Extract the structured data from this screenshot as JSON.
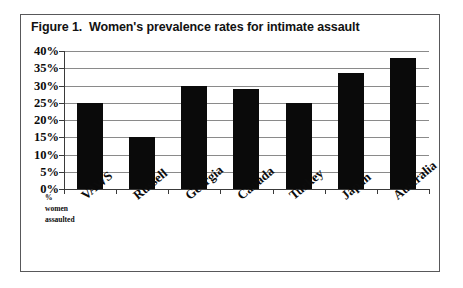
{
  "figure": {
    "title": "Figure 1.  Women's prevalence rates for intimate assault",
    "border_color": "#58585a",
    "background": "#ffffff"
  },
  "axis_caption": {
    "line1": "%",
    "line2": "women",
    "line3": "assaulted"
  },
  "chart_data": {
    "type": "bar",
    "title": "Figure 1.  Women's prevalence rates for intimate assault",
    "categories": [
      "VAWS",
      "Russell",
      "Georgia",
      "Canada",
      "Turkey",
      "Japan",
      "Australia"
    ],
    "values": [
      25,
      15,
      30,
      29,
      25,
      33.5,
      38
    ],
    "xlabel": "",
    "ylabel": "% women assaulted",
    "ylim": [
      0,
      40
    ],
    "ytick_step": 5,
    "ytick_labels": [
      "40%",
      "35%",
      "30%",
      "25%",
      "20%",
      "15%",
      "10%",
      "5%",
      "0%"
    ],
    "ytick_values": [
      40,
      35,
      30,
      25,
      20,
      15,
      10,
      5,
      0
    ],
    "grid": true,
    "legend": false,
    "bar_color": "#0a0a0a",
    "gridline_color": "#8a8a8a"
  }
}
